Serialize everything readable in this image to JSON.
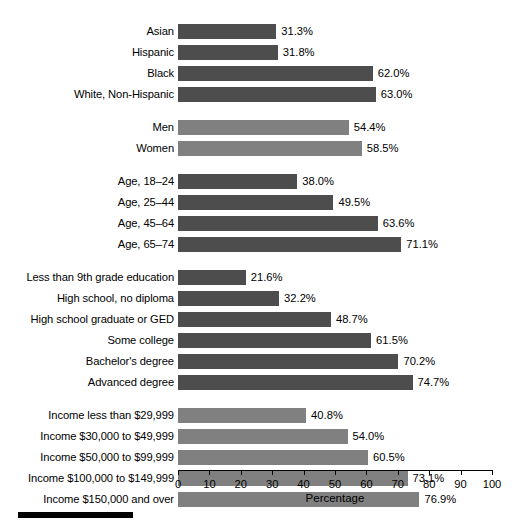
{
  "chart_data": {
    "type": "bar",
    "orientation": "horizontal",
    "title": "",
    "xlabel": "Percentage",
    "ylabel": "",
    "xlim": [
      0,
      100
    ],
    "xticks": [
      0,
      10,
      20,
      30,
      40,
      50,
      60,
      70,
      80,
      90,
      100
    ],
    "xtick_labels": [
      "0",
      "10",
      "20",
      "30",
      "40",
      "50",
      "60",
      "70",
      "80",
      "90",
      "100"
    ],
    "grid": false,
    "legend": "none",
    "value_label_suffix": "%",
    "colors": {
      "dark_bar": "#4d4d4d",
      "light_bar": "#808080",
      "axis": "#000000",
      "text": "#000000",
      "background": "#ffffff",
      "bottom_rule": "#000000"
    },
    "groups": [
      {
        "name": "race-ethnicity",
        "shade": "dark",
        "categories": [
          "Asian",
          "Hispanic",
          "Black",
          "White, Non-Hispanic"
        ],
        "values": [
          31.3,
          31.8,
          62.0,
          63.0
        ],
        "value_labels": [
          "31.3%",
          "31.8%",
          "62.0%",
          "63.0%"
        ]
      },
      {
        "name": "sex",
        "shade": "light",
        "categories": [
          "Men",
          "Women"
        ],
        "values": [
          54.4,
          58.5
        ],
        "value_labels": [
          "54.4%",
          "58.5%"
        ]
      },
      {
        "name": "age",
        "shade": "dark",
        "categories": [
          "Age, 18–24",
          "Age, 25–44",
          "Age, 45–64",
          "Age, 65–74"
        ],
        "values": [
          38.0,
          49.5,
          63.6,
          71.1
        ],
        "value_labels": [
          "38.0%",
          "49.5%",
          "63.6%",
          "71.1%"
        ]
      },
      {
        "name": "education",
        "shade": "dark",
        "categories": [
          "Less than 9th grade education",
          "High school, no diploma",
          "High school graduate or GED",
          "Some college",
          "Bachelor's degree",
          "Advanced degree"
        ],
        "values": [
          21.6,
          32.2,
          48.7,
          61.5,
          70.2,
          74.7
        ],
        "value_labels": [
          "21.6%",
          "32.2%",
          "48.7%",
          "61.5%",
          "70.2%",
          "74.7%"
        ]
      },
      {
        "name": "income",
        "shade": "light",
        "categories": [
          "Income less than $29,999",
          "Income $30,000 to $49,999",
          "Income $50,000 to $99,999",
          "Income $100,000 to $149,999",
          "Income $150,000 and over"
        ],
        "values": [
          40.8,
          54.0,
          60.5,
          73.1,
          76.9
        ],
        "value_labels": [
          "40.8%",
          "54.0%",
          "60.5%",
          "73.1%",
          "76.9%"
        ]
      }
    ]
  }
}
